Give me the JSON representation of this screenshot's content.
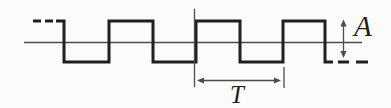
{
  "figure": {
    "canvas": {
      "width": 391,
      "height": 107
    },
    "colors": {
      "background": "#fbfbf9",
      "wave": "#1f1f1e",
      "thin_line": "#4c4c4a",
      "ink": "#1e1e1c"
    },
    "baseline": {
      "x1": 24,
      "x2": 362,
      "y": 42.5
    },
    "wave": {
      "type": "square",
      "high_y": 21,
      "low_y": 62,
      "stroke_width": 3,
      "solid_start_x": 56,
      "solid_start_level": "high",
      "transition_x": [
        64,
        109,
        153,
        196,
        240,
        283,
        325
      ],
      "solid_end_x": 333,
      "lead_dashes_high": [
        [
          33,
          41
        ],
        [
          45,
          53
        ]
      ],
      "tail_dashes_low": [
        [
          338,
          349
        ],
        [
          356,
          368
        ]
      ]
    },
    "period_marker": {
      "label": "T",
      "left_line": {
        "x": 194.5,
        "y1": 9,
        "y2": 87
      },
      "right_line": {
        "x": 284,
        "y1": 67,
        "y2": 88
      },
      "arrow": {
        "x1": 197,
        "x2": 281,
        "y": 80.5
      },
      "label_pos": {
        "x": 237,
        "y": 102.5
      }
    },
    "amplitude_marker": {
      "label": "A",
      "arrow": {
        "x": 343.5,
        "y1": 19.5,
        "y2": 58
      },
      "label_pos": {
        "x": 354,
        "y": 36
      }
    }
  }
}
